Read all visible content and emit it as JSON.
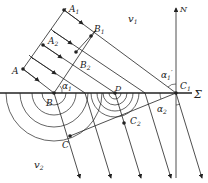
{
  "diagram": {
    "type": "wave refraction (Huygens construction)",
    "media": {
      "upper": {
        "label": "v",
        "sub": "1"
      },
      "lower": {
        "label": "v",
        "sub": "2"
      }
    },
    "interface_label": "Σ",
    "normal_label": "N",
    "points": {
      "A": {
        "label": "A",
        "sub": ""
      },
      "A1": {
        "label": "A",
        "sub": "1"
      },
      "A2": {
        "label": "A",
        "sub": "2"
      },
      "B": {
        "label": "B",
        "sub": ""
      },
      "B1": {
        "label": "B",
        "sub": "1"
      },
      "B2": {
        "label": "B",
        "sub": "2"
      },
      "C": {
        "label": "C",
        "sub": ""
      },
      "C1": {
        "label": "C",
        "sub": "1"
      },
      "C2": {
        "label": "C",
        "sub": "2"
      },
      "D": {
        "label": "D",
        "sub": ""
      }
    },
    "angles": {
      "alpha1": {
        "label": "α",
        "sub": "1"
      },
      "alpha1_prime": {
        "label": "α",
        "sub": "1",
        "prime": "′"
      },
      "alpha2": {
        "label": "α",
        "sub": "2"
      }
    },
    "colors": {
      "line": "#222222",
      "background": "#ffffff"
    }
  }
}
